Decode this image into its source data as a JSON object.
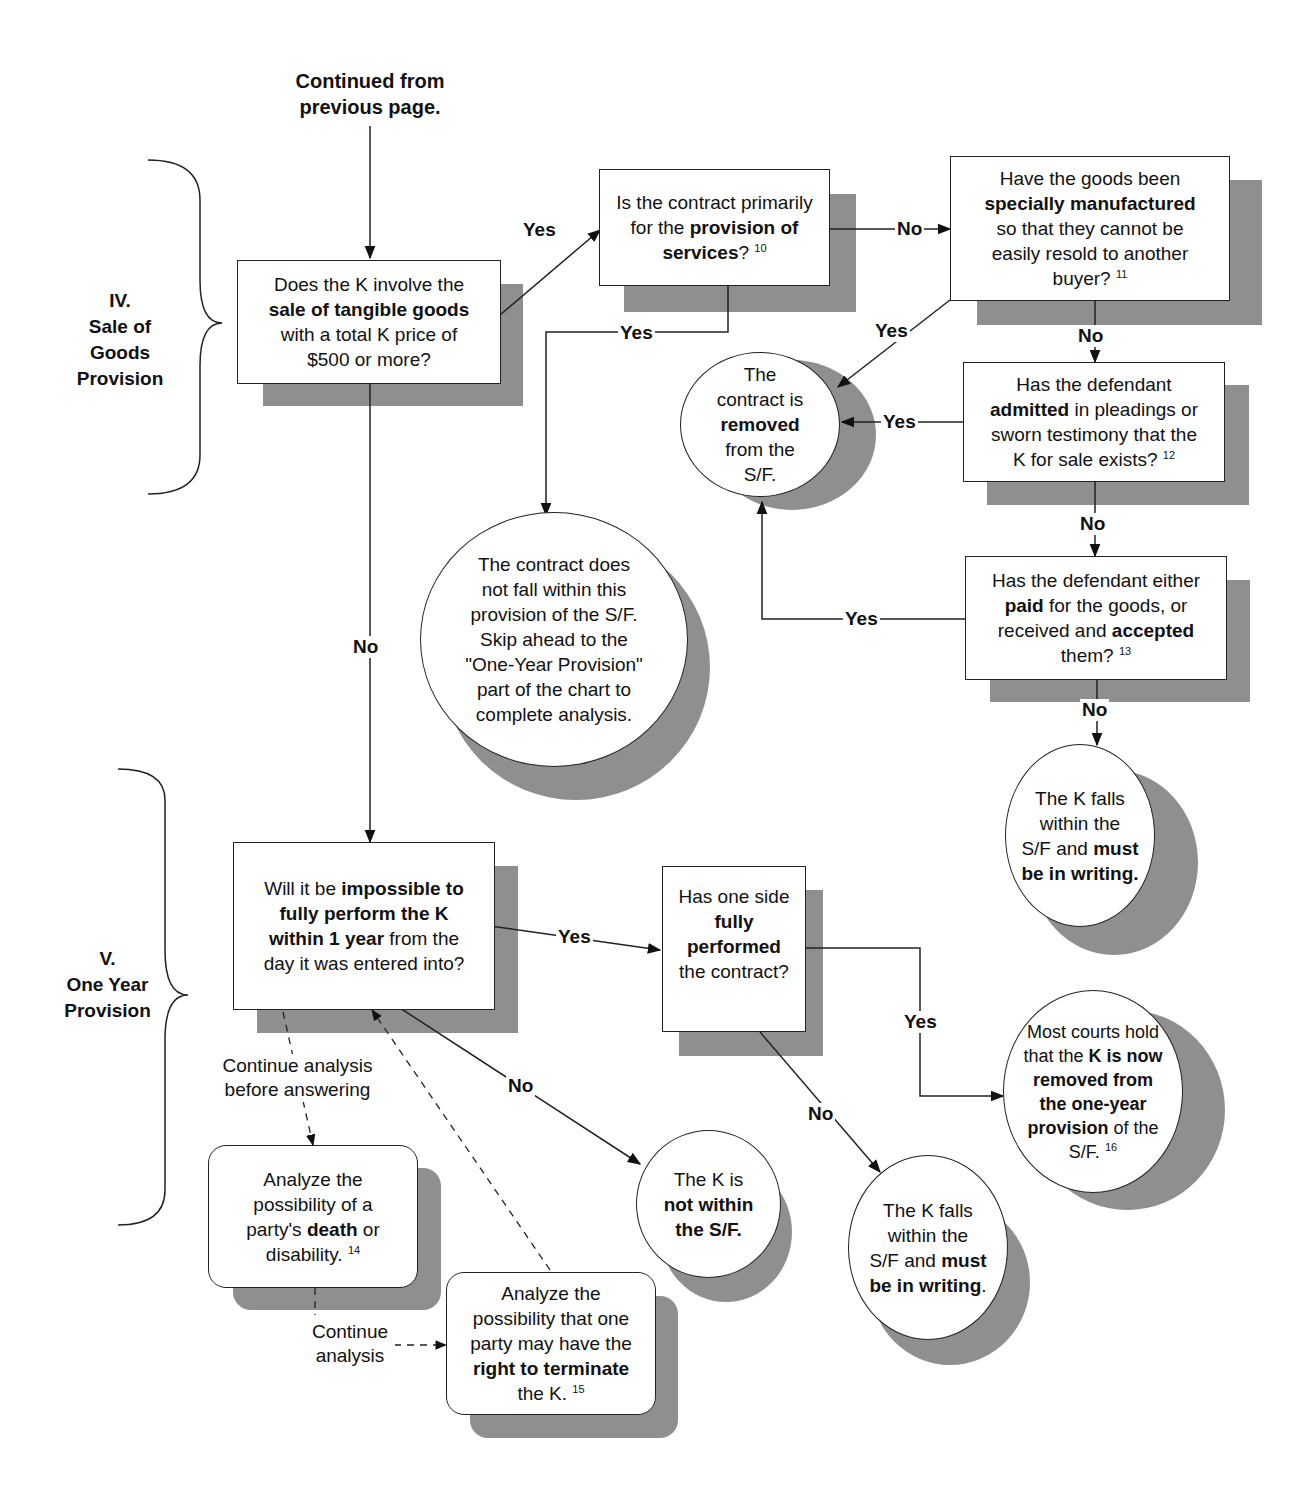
{
  "header": {
    "continued_line1": "Continued from",
    "continued_line2": "previous page."
  },
  "sections": [
    {
      "id": "iv",
      "numeral": "IV.",
      "line1": "Sale of",
      "line2": "Goods",
      "line3": "Provision"
    },
    {
      "id": "v",
      "numeral": "V.",
      "line1": "One Year",
      "line2": "Provision"
    }
  ],
  "nodes": {
    "sale_goods": {
      "shape": "rect",
      "t1": "Does the K involve the",
      "b1": "sale of tangible goods",
      "t2": "with a total K price of",
      "t3": "$500 or more?"
    },
    "services": {
      "shape": "rect",
      "t1": "Is the contract primarily",
      "t2": "for the ",
      "b1": "provision of",
      "b2": "services",
      "t3": "?",
      "fn": "10"
    },
    "manufactured": {
      "shape": "rect",
      "t1": "Have the goods been",
      "b1": "specially manufactured",
      "t2": "so that they cannot be",
      "t3": "easily resold to another",
      "t4": "buyer?",
      "fn": "11"
    },
    "removed": {
      "shape": "circle",
      "t1": "The",
      "t2": "contract is",
      "b1": "removed",
      "t3": "from the",
      "t4": "S/F."
    },
    "admitted": {
      "shape": "rect",
      "t1": "Has the defendant",
      "b1": "admitted",
      "t2": " in pleadings or",
      "t3": "sworn testimony that the",
      "t4": "K for sale exists?",
      "fn": "12"
    },
    "not_within_provision": {
      "shape": "circle",
      "t1": "The contract does",
      "t2": "not fall within this",
      "t3": "provision of the S/F.",
      "t4": "Skip ahead to the",
      "t5": "\"One-Year Provision\"",
      "t6": "part of the chart to",
      "t7": "complete analysis."
    },
    "paid": {
      "shape": "rect",
      "t1": "Has the defendant either",
      "b1": "paid",
      "t2": " for the goods, or",
      "t3": "received and ",
      "b2": "accepted",
      "t4": "them?",
      "fn": "13"
    },
    "falls_within_goods": {
      "shape": "circle",
      "t1": "The K falls",
      "t2": "within the",
      "t3": "S/F and ",
      "b1": "must",
      "b2": "be in writing."
    },
    "impossible_year": {
      "shape": "rect",
      "t1": "Will it be ",
      "b1": "impossible to",
      "b2": "fully perform the K",
      "b3": "within 1 year",
      "t2": " from the",
      "t3": "day it was entered into?"
    },
    "fully_performed": {
      "shape": "rect",
      "t1": "Has one side",
      "b1": "fully performed",
      "t2": "the contract?"
    },
    "courts_hold": {
      "shape": "circle",
      "t1": "Most courts hold",
      "t2": "that the ",
      "b1": "K is now",
      "b2": "removed from",
      "b3": "the one-year",
      "b4": "provision",
      "t3": " of the",
      "t4": "S/F.",
      "fn": "16"
    },
    "death": {
      "shape": "rounded",
      "t1": "Analyze the",
      "t2": "possibility of a",
      "t3": "party's ",
      "b1": "death",
      "t4": " or",
      "t5": "disability.",
      "fn": "14"
    },
    "terminate": {
      "shape": "rounded",
      "t1": "Analyze the",
      "t2": "possibility that one",
      "t3": "party may have the",
      "b1": "right to terminate",
      "t4": "the K.",
      "fn": "15"
    },
    "not_within_sf": {
      "shape": "circle",
      "t1": "The K is",
      "b1": "not within",
      "b2": "the S/F."
    },
    "falls_within_year": {
      "shape": "circle",
      "t1": "The K falls",
      "t2": "within the",
      "t3": "S/F and ",
      "b1": "must",
      "b2": "be in writing",
      "t4": "."
    }
  },
  "edge_labels": {
    "goods_yes": "Yes",
    "goods_no": "No",
    "services_no": "No",
    "services_yes": "Yes",
    "manufactured_yes": "Yes",
    "manufactured_no": "No",
    "admitted_yes": "Yes",
    "admitted_no": "No",
    "paid_yes": "Yes",
    "paid_no": "No",
    "year_yes": "Yes",
    "year_no": "No",
    "performed_yes": "Yes",
    "performed_no": "No"
  },
  "notes": {
    "continue_before_1": "Continue analysis",
    "continue_before_2": "before answering",
    "continue_1": "Continue",
    "continue_2": "analysis"
  },
  "colors": {
    "shadow": "#8f8f8f",
    "stroke": "#222222",
    "background": "#ffffff"
  }
}
